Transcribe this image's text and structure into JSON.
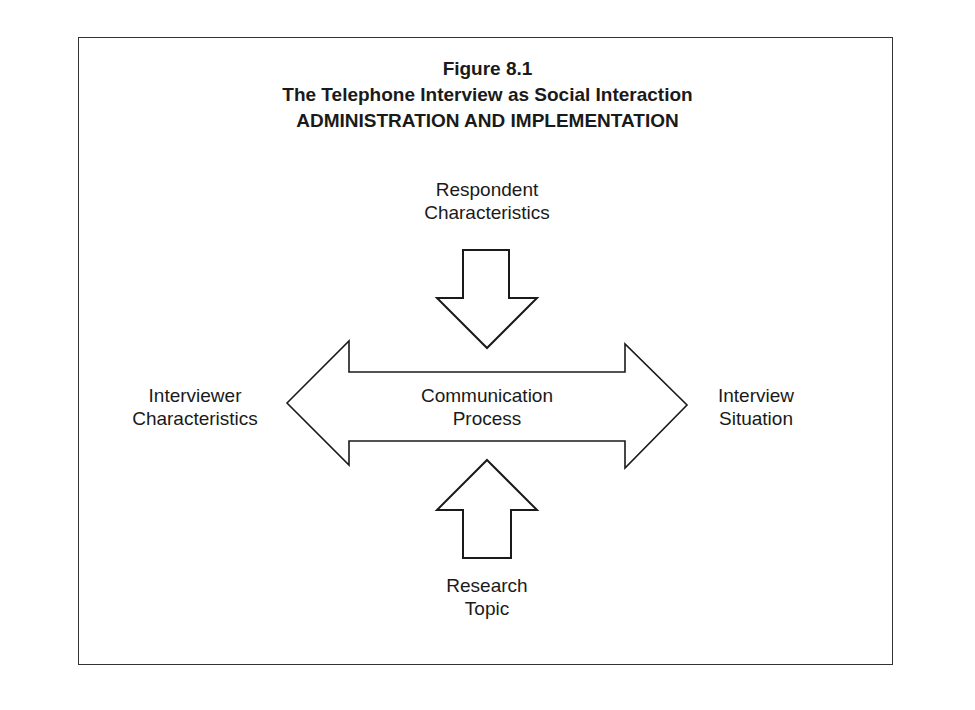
{
  "figure": {
    "number": "Figure 8.1",
    "title": "The Telephone Interview as Social Interaction",
    "subtitle": "ADMINISTRATION AND IMPLEMENTATION"
  },
  "nodes": {
    "top": [
      "Respondent",
      "Characteristics"
    ],
    "left": [
      "Interviewer",
      "Characteristics"
    ],
    "center": [
      "Communication",
      "Process"
    ],
    "right": [
      "Interview",
      "Situation"
    ],
    "bottom": [
      "Research",
      "Topic"
    ]
  },
  "colors": {
    "stroke": "#1a1a1a",
    "fill": "#ffffff"
  }
}
